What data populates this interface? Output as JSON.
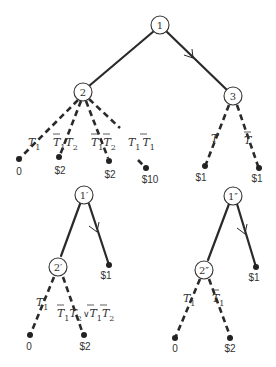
{
  "diagram": {
    "trees": [
      {
        "id": "main",
        "nodes": [
          {
            "id": "n1",
            "label": "1"
          },
          {
            "id": "n2",
            "label": "2"
          },
          {
            "id": "n3",
            "label": "3"
          }
        ],
        "edges": [
          {
            "from": "n1",
            "to": "n2",
            "style": "solid"
          },
          {
            "from": "n1",
            "to": "n3",
            "style": "solid",
            "arrow": true
          }
        ],
        "leaves": [
          {
            "parent": "n2",
            "condition": "T1",
            "payoff": "0"
          },
          {
            "parent": "n2",
            "condition": "¬T1 T2",
            "payoff": "$2"
          },
          {
            "parent": "n2",
            "condition": "¬T1 ¬T2",
            "payoff": "$2"
          },
          {
            "parent": "n2",
            "condition": "T1 ¬T1",
            "payoff": "$10"
          },
          {
            "parent": "n3",
            "condition": "T",
            "payoff": "$1"
          },
          {
            "parent": "n3",
            "condition": "¬T",
            "payoff": "$1"
          }
        ]
      },
      {
        "id": "prime",
        "nodes": [
          {
            "id": "n1p",
            "label": "1′"
          },
          {
            "id": "n2p",
            "label": "2′"
          }
        ],
        "edges": [
          {
            "from": "n1p",
            "to": "n2p",
            "style": "solid"
          },
          {
            "from": "n1p",
            "to": "leaf",
            "style": "solid",
            "arrow": true,
            "payoff": "$1"
          }
        ],
        "leaves": [
          {
            "parent": "n2p",
            "condition": "T1",
            "payoff": "0"
          },
          {
            "parent": "n2p",
            "condition": "¬T1 T2 ∨ ¬T1 ¬T2",
            "payoff": "$2"
          }
        ]
      },
      {
        "id": "double-prime",
        "nodes": [
          {
            "id": "n1pp",
            "label": "1″"
          },
          {
            "id": "n2pp",
            "label": "2″"
          }
        ],
        "edges": [
          {
            "from": "n1pp",
            "to": "n2pp",
            "style": "solid"
          },
          {
            "from": "n1pp",
            "to": "leaf",
            "style": "solid",
            "arrow": true,
            "payoff": "$1"
          }
        ],
        "leaves": [
          {
            "parent": "n2pp",
            "condition": "T1",
            "payoff": "0"
          },
          {
            "parent": "n2pp",
            "condition": "¬T1",
            "payoff": "$2"
          }
        ]
      }
    ],
    "text": {
      "n1": "1",
      "n2": "2",
      "n3": "3",
      "n1p": "1′",
      "n2p": "2′",
      "n1pp": "1″",
      "n2pp": "2″",
      "pay_a": "0",
      "pay_b": "$2",
      "pay_c": "$2",
      "pay_d": "$10",
      "pay_e": "$1",
      "pay_f": "$1",
      "pay_g": "$1",
      "pay_h": "0",
      "pay_i": "$2",
      "pay_j": "$1",
      "pay_k": "0",
      "pay_l": "$2",
      "T": "T",
      "one": "1",
      "two": "2",
      "or": "∨"
    }
  }
}
